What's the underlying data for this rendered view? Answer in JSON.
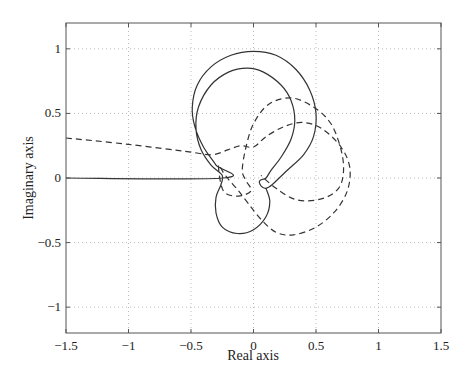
{
  "chart_data": {
    "type": "line",
    "title": "",
    "xlabel": "Real axis",
    "ylabel": "Imaginary axis",
    "xlim": [
      -1.5,
      1.5
    ],
    "ylim": [
      -1.2,
      1.2
    ],
    "grid": true,
    "legend": null,
    "xticks": [
      -1.5,
      -1,
      -0.5,
      0,
      0.5,
      1,
      1.5
    ],
    "xtick_labels": [
      "−1.5",
      "−1",
      "−0.5",
      "0",
      "0.5",
      "1",
      "1.5"
    ],
    "yticks": [
      1,
      0.5,
      0,
      -0.5,
      -1
    ],
    "ytick_labels": [
      "1",
      "0.5",
      "0",
      "−0.5",
      "−1"
    ],
    "series": [
      {
        "name": "solid-curve",
        "style": "solid",
        "points": [
          [
            -1.5,
            0.0
          ],
          [
            -0.24,
            0.0
          ],
          [
            -0.3,
            0.1
          ],
          [
            -0.4,
            0.24
          ],
          [
            -0.47,
            0.4
          ],
          [
            -0.49,
            0.55
          ],
          [
            -0.45,
            0.72
          ],
          [
            -0.34,
            0.86
          ],
          [
            -0.18,
            0.95
          ],
          [
            0.0,
            0.98
          ],
          [
            0.18,
            0.95
          ],
          [
            0.34,
            0.84
          ],
          [
            0.45,
            0.68
          ],
          [
            0.5,
            0.5
          ],
          [
            0.48,
            0.32
          ],
          [
            0.4,
            0.18
          ],
          [
            0.27,
            0.06
          ],
          [
            0.15,
            -0.05
          ],
          [
            0.1,
            -0.08
          ],
          [
            0.06,
            -0.06
          ],
          [
            0.05,
            -0.02
          ],
          [
            0.1,
            0.0
          ],
          [
            0.14,
            0.06
          ],
          [
            0.22,
            0.16
          ],
          [
            0.3,
            0.3
          ],
          [
            0.33,
            0.45
          ],
          [
            0.3,
            0.6
          ],
          [
            0.22,
            0.72
          ],
          [
            0.08,
            0.82
          ],
          [
            -0.05,
            0.85
          ],
          [
            -0.2,
            0.82
          ],
          [
            -0.34,
            0.72
          ],
          [
            -0.44,
            0.55
          ],
          [
            -0.46,
            0.38
          ],
          [
            -0.42,
            0.22
          ],
          [
            -0.34,
            0.1
          ],
          [
            -0.25,
            0.02
          ],
          [
            -0.26,
            -0.05
          ],
          [
            -0.3,
            -0.15
          ],
          [
            -0.3,
            -0.27
          ],
          [
            -0.25,
            -0.38
          ],
          [
            -0.13,
            -0.43
          ],
          [
            0.0,
            -0.4
          ],
          [
            0.1,
            -0.3
          ],
          [
            0.13,
            -0.18
          ],
          [
            0.1,
            -0.08
          ]
        ]
      },
      {
        "name": "dashed-curve",
        "style": "dashed",
        "points": [
          [
            -1.5,
            0.31
          ],
          [
            -1.0,
            0.26
          ],
          [
            -0.5,
            0.2
          ],
          [
            -0.33,
            0.18
          ],
          [
            -0.2,
            0.22
          ],
          [
            -0.1,
            0.25
          ],
          [
            0.0,
            0.24
          ],
          [
            0.1,
            0.32
          ],
          [
            0.25,
            0.4
          ],
          [
            0.4,
            0.43
          ],
          [
            0.55,
            0.38
          ],
          [
            0.7,
            0.24
          ],
          [
            0.77,
            0.08
          ],
          [
            0.75,
            -0.1
          ],
          [
            0.65,
            -0.26
          ],
          [
            0.5,
            -0.38
          ],
          [
            0.32,
            -0.44
          ],
          [
            0.18,
            -0.42
          ],
          [
            0.06,
            -0.32
          ],
          [
            -0.04,
            -0.2
          ],
          [
            -0.12,
            -0.1
          ],
          [
            -0.2,
            -0.01
          ],
          [
            -0.24,
            0.04
          ],
          [
            -0.28,
            0.1
          ],
          [
            -0.26,
            -0.05
          ],
          [
            -0.22,
            -0.12
          ],
          [
            -0.12,
            -0.14
          ],
          [
            -0.02,
            -0.1
          ],
          [
            -0.06,
            -0.02
          ],
          [
            -0.09,
            0.06
          ],
          [
            -0.06,
            0.24
          ],
          [
            0.0,
            0.42
          ],
          [
            0.12,
            0.57
          ],
          [
            0.3,
            0.62
          ],
          [
            0.48,
            0.55
          ],
          [
            0.62,
            0.42
          ],
          [
            0.7,
            0.22
          ],
          [
            0.72,
            0.05
          ],
          [
            0.68,
            -0.08
          ],
          [
            0.55,
            -0.16
          ],
          [
            0.35,
            -0.17
          ],
          [
            0.18,
            -0.08
          ],
          [
            0.06,
            0.02
          ]
        ]
      }
    ]
  }
}
